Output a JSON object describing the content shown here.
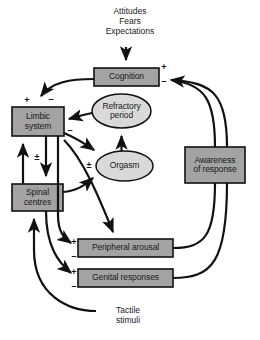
{
  "diagram": {
    "colors": {
      "box_fill": "#a3a3a3",
      "ellipse_fill": "#d9d9d9",
      "stroke": "#111111",
      "text": "#1a1a1a",
      "background": "#ffffff"
    },
    "nodes": [
      {
        "id": "cognition",
        "label": "Cognition",
        "shape": "box",
        "x": 94,
        "y": 68,
        "w": 65,
        "h": 18
      },
      {
        "id": "limbic-system",
        "label": "Limbic\nsystem",
        "shape": "box",
        "x": 12,
        "y": 107,
        "w": 52,
        "h": 29
      },
      {
        "id": "spinal-centres",
        "label": "Spinal\ncentres",
        "shape": "box",
        "x": 12,
        "y": 184,
        "w": 51,
        "h": 27
      },
      {
        "id": "refractory-period",
        "label": "Refractory\nperiod",
        "shape": "ellipse",
        "x": 92,
        "y": 94,
        "w": 59,
        "h": 34
      },
      {
        "id": "orgasm",
        "label": "Orgasm",
        "shape": "ellipse",
        "x": 96,
        "y": 151,
        "w": 57,
        "h": 30
      },
      {
        "id": "peripheral-arousal",
        "label": "Peripheral arousal",
        "shape": "box",
        "x": 78,
        "y": 239,
        "w": 95,
        "h": 18
      },
      {
        "id": "genital-responses",
        "label": "Genital responses",
        "shape": "box",
        "x": 78,
        "y": 269,
        "w": 95,
        "h": 18
      },
      {
        "id": "awareness",
        "label": "Awareness\nof response",
        "shape": "box",
        "x": 185,
        "y": 147,
        "w": 60,
        "h": 36
      }
    ],
    "annotations": [
      {
        "id": "input-stimuli",
        "text": "Attitudes\nFears\nExpectations",
        "x": 86,
        "y": 6,
        "w": 88
      },
      {
        "id": "tactile-stimuli",
        "text": "Tactile\nstimuli",
        "x": 100,
        "y": 305,
        "w": 56
      }
    ],
    "signs": [
      {
        "id": "cognition-plus",
        "symbol": "+",
        "x": 160,
        "y": 63
      },
      {
        "id": "cognition-minus",
        "symbol": "–",
        "x": 160,
        "y": 77
      },
      {
        "id": "limbic-plus",
        "symbol": "+",
        "x": 23,
        "y": 96
      },
      {
        "id": "limbic-minus",
        "symbol": "–",
        "x": 47,
        "y": 95
      },
      {
        "id": "limbic-out-minus",
        "symbol": "–",
        "x": 66,
        "y": 126
      },
      {
        "id": "limbic-spinal-plusminus",
        "symbol": "±",
        "x": 33,
        "y": 153
      },
      {
        "id": "orgasm-plusminus",
        "symbol": "±",
        "x": 85,
        "y": 161
      },
      {
        "id": "peripheral-plus",
        "symbol": "+",
        "x": 70,
        "y": 238
      },
      {
        "id": "peripheral-minus",
        "symbol": "–",
        "x": 70,
        "y": 252
      },
      {
        "id": "genital-plus",
        "symbol": "+",
        "x": 70,
        "y": 268
      },
      {
        "id": "genital-minus",
        "symbol": "–",
        "x": 70,
        "y": 282
      }
    ]
  }
}
